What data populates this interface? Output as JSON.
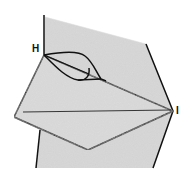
{
  "diagram": {
    "type": "origami-fold-step",
    "labels": {
      "point_h": "H",
      "point_i": "I"
    },
    "colors": {
      "paper": "#cfcfcf",
      "line": "#111111",
      "background": "#ffffff"
    }
  }
}
